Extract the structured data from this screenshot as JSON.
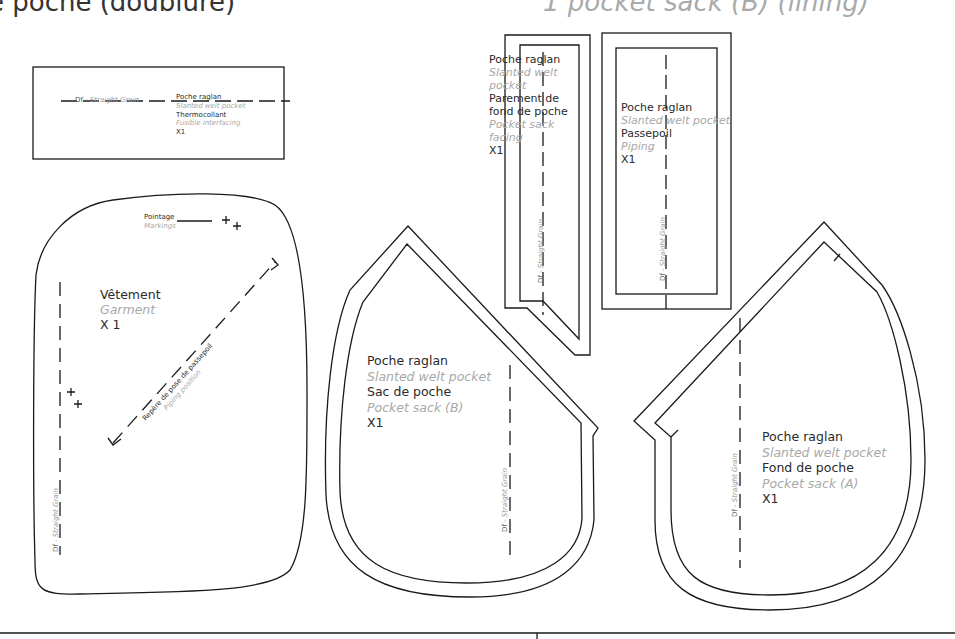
{
  "header": {
    "left_title": "e poche (doublure)",
    "right_title": "1 pocket sack (B) (lining)"
  },
  "grain": {
    "prefix": "Df",
    "sep": " - ",
    "label": "Straight Grain"
  },
  "pieces": {
    "thermocollant": {
      "name_fr": "Poche raglan",
      "name_en": "Slanted welt pocket",
      "part_fr": "Thermocollant",
      "part_en": "Fusible interfacing",
      "qty": "X1"
    },
    "parement": {
      "name_fr": "Poche raglan",
      "name_en_1": "Slanted welt",
      "name_en_2": "pocket",
      "part_fr_1": "Parement de",
      "part_fr_2": "fond de poche",
      "part_en_1": "Pocket sack",
      "part_en_2": "facing",
      "qty": "X1"
    },
    "passepoil": {
      "name_fr": "Poche raglan",
      "name_en": "Slanted welt pocket",
      "part_fr": "Passepoil",
      "part_en": "Piping",
      "qty": "X1"
    },
    "vetement": {
      "part_fr": "Vêtement",
      "part_en": "Garment",
      "qty": "X 1",
      "markings_fr": "Pointage",
      "markings_en": "Markings",
      "piping_fr": "Repère de pose de passepoil",
      "piping_en": "Piping position"
    },
    "sac_b": {
      "name_fr": "Poche raglan",
      "name_en": "Slanted welt pocket",
      "part_fr": "Sac de poche",
      "part_en": "Pocket sack (B)",
      "qty": "X1"
    },
    "fond_a": {
      "name_fr": "Poche raglan",
      "name_en": "Slanted welt pocket",
      "part_fr": "Fond de poche",
      "part_en": "Pocket sack (A)",
      "qty": "X1"
    }
  }
}
